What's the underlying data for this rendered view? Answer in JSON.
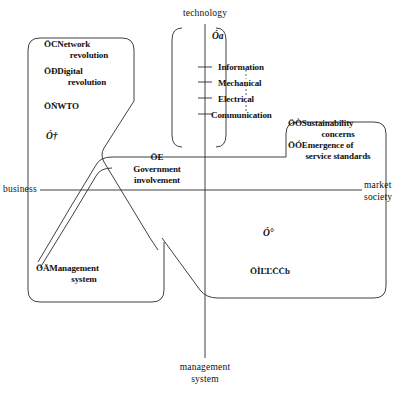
{
  "diagram": {
    "axes": {
      "vertical_top_label": "technology",
      "vertical_bottom_label": "management\nsystem",
      "vertical_bottom_line1": "management",
      "vertical_bottom_line2": "system",
      "horizontal_left_label": "business",
      "horizontal_right_line1": "market",
      "horizontal_right_line2": "society"
    },
    "technology_ticks": [
      {
        "label": "Information"
      },
      {
        "label": "Mechanical"
      },
      {
        "label": "Electrical"
      },
      {
        "label": "Communication"
      }
    ],
    "markers": [
      {
        "id": "marker-a",
        "text": "Óa"
      },
      {
        "id": "marker-dagger",
        "text": "Ó†"
      },
      {
        "id": "marker-degree",
        "text": "Ó°"
      }
    ],
    "boxes": [
      {
        "id": "upper-left-box",
        "items": [
          {
            "marker": "ÖC",
            "line1": "Network",
            "line2": "revolution"
          },
          {
            "marker": "ÖÐ",
            "line1": "Digital",
            "line2": "revolution"
          },
          {
            "marker": "ÖÑ",
            "line1": "WTO",
            "line2": ""
          }
        ]
      },
      {
        "id": "government-box",
        "items": [
          {
            "marker": "ÖE",
            "line1": "Government",
            "line2": "involvement"
          }
        ]
      },
      {
        "id": "right-box",
        "items": [
          {
            "marker": "ÖÒ",
            "line1": "Sustainability",
            "line2": "concerns"
          },
          {
            "marker": "ÖÓ",
            "line1": "Emergence of",
            "line2": "service standards"
          }
        ]
      },
      {
        "id": "management-system-box",
        "items": [
          {
            "marker": "ÖÄ",
            "line1": "Management",
            "line2": "system"
          }
        ]
      },
      {
        "id": "lower-right-box",
        "items": [
          {
            "marker": "ÖÌ",
            "line1": "ĽĽĊĊb",
            "line2": ""
          }
        ]
      }
    ],
    "colors": {
      "stroke": "#2b2b2b",
      "text": "#101010",
      "background": "#ffffff"
    }
  }
}
